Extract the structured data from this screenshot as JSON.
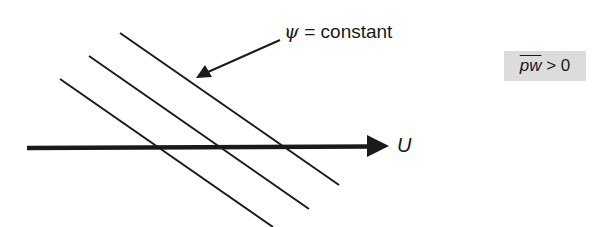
{
  "diagram": {
    "streamline_label": {
      "symbol": "ψ",
      "text": " = constant"
    },
    "flow_label": "U",
    "condition": {
      "variable": "pw",
      "relation": " > 0"
    },
    "colors": {
      "line": "#1a1a1a",
      "condition_box_bg": "#dcdcdc",
      "background": "#ffffff"
    },
    "streamlines": [
      {
        "x1": 120,
        "y1": 33,
        "x2": 339,
        "y2": 185
      },
      {
        "x1": 89,
        "y1": 56,
        "x2": 309,
        "y2": 209
      },
      {
        "x1": 60,
        "y1": 79,
        "x2": 273,
        "y2": 227
      }
    ],
    "flow_arrow": {
      "x1": 27,
      "y1": 148,
      "x2": 388,
      "y2": 146
    },
    "leader_arrow": {
      "x1": 280,
      "y1": 40,
      "x2": 197,
      "y2": 78
    }
  }
}
